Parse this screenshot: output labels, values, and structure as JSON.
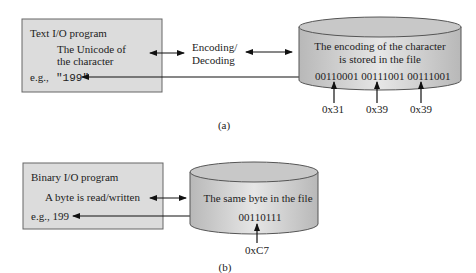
{
  "panel_a": {
    "program_box": {
      "title": "Text I/O program",
      "line1": "The Unicode of",
      "line2": "the character",
      "example_prefix": "e.g.,",
      "example_value": "\"199\""
    },
    "arrow_label_line1": "Encoding/",
    "arrow_label_line2": "Decoding",
    "file": {
      "line1": "The encoding of the character",
      "line2": "is stored in the file",
      "bits": "00110001 00111001 00111001",
      "hex": [
        "0x31",
        "0x39",
        "0x39"
      ]
    },
    "caption": "(a)"
  },
  "panel_b": {
    "program_box": {
      "title": "Binary I/O program",
      "line1": "A byte is read/written",
      "example": "e.g., 199"
    },
    "file": {
      "line1": "The same byte in the file",
      "bits": "00110111",
      "hex": "0xC7"
    },
    "caption": "(b)"
  },
  "colors": {
    "box_fill": "#dcdcdc",
    "cylinder_fill": "#d0d0d0",
    "stroke": "#555555"
  }
}
